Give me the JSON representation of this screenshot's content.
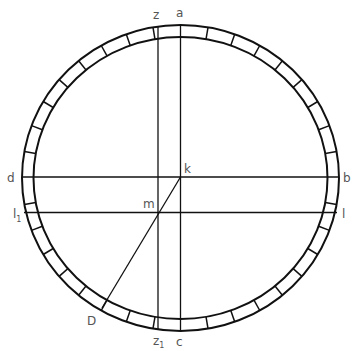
{
  "diagram": {
    "type": "geometric-construction",
    "stroke_color": "#111111",
    "label_color": "#555555",
    "ring": {
      "center": [
        180.5,
        178
      ],
      "outer_radius": [
        158.5,
        153
      ],
      "inner_radius": [
        147,
        141
      ],
      "tick_step_deg": 10
    },
    "labels": {
      "a": "a",
      "z": "z",
      "b": "b",
      "c": "c",
      "d": "d",
      "k": "k",
      "m": "m",
      "l": "l",
      "l1": "l",
      "l1_sub": "1",
      "z1": "z",
      "z1_sub": "1",
      "D": "D"
    },
    "lines": [
      {
        "name": "a-c",
        "from": "a",
        "to": "c"
      },
      {
        "name": "z-z1",
        "from": "z",
        "to": "z1"
      },
      {
        "name": "d-b",
        "from": "d",
        "to": "b"
      },
      {
        "name": "l1-l",
        "from": "l1",
        "to": "l"
      },
      {
        "name": "k-D",
        "from": "k",
        "to": "D",
        "through": "m"
      }
    ]
  }
}
